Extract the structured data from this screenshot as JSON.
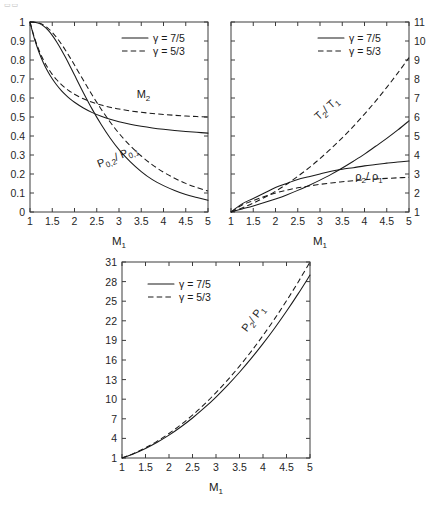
{
  "figure": {
    "corner_mark": "▭▭",
    "background": "#ffffff",
    "line_color": "#1a1a1a"
  },
  "legend": {
    "solid_label": "γ = 7/5",
    "dashed_label": "γ = 5/3",
    "solid_style": "solid",
    "dashed_style": "dashed"
  },
  "chart_data": [
    {
      "id": "panel-1",
      "type": "line",
      "title": "",
      "xlabel": "M₁",
      "ylabel": "",
      "xlim": [
        1,
        5
      ],
      "ylim": [
        0,
        1
      ],
      "xticks": [
        1,
        1.5,
        2,
        2.5,
        3,
        3.5,
        4,
        4.5,
        5
      ],
      "xticklabels": [
        "1",
        "1.5",
        "2",
        "2.5",
        "3",
        "3.5",
        "4",
        "4.5",
        "5"
      ],
      "yticks": [
        0,
        0.1,
        0.2,
        0.3,
        0.4,
        0.5,
        0.6,
        0.7,
        0.8,
        0.9,
        1
      ],
      "yticklabels": [
        "0",
        "0.1",
        "0.2",
        "0.3",
        "0.4",
        "0.5",
        "0.6",
        "0.7",
        "0.8",
        "0.9",
        "1"
      ],
      "y_axis_side": "left",
      "grid": false,
      "legend_position": "upper-right",
      "annotations": [
        {
          "text": "M",
          "sub": "2",
          "x": 3.55,
          "y": 0.6,
          "rotation": 0
        },
        {
          "text": "P",
          "sub": "0,2",
          "text2": "/ P",
          "sub2": "0,1",
          "x": 3.0,
          "y": 0.275,
          "rotation": -22
        }
      ],
      "series": [
        {
          "name": "M2 (γ = 7/5)",
          "style": "solid",
          "x": [
            1,
            1.1,
            1.2,
            1.3,
            1.4,
            1.5,
            1.6,
            1.7,
            1.8,
            1.9,
            2,
            2.2,
            2.4,
            2.6,
            2.8,
            3,
            3.25,
            3.5,
            3.75,
            4,
            4.25,
            4.5,
            4.75,
            5
          ],
          "values": [
            1,
            0.9118,
            0.8422,
            0.786,
            0.7397,
            0.7011,
            0.6684,
            0.6405,
            0.6165,
            0.5956,
            0.5774,
            0.5471,
            0.5231,
            0.5039,
            0.4882,
            0.4752,
            0.4619,
            0.4512,
            0.4423,
            0.435,
            0.4289,
            0.4236,
            0.4192,
            0.4152
          ]
        },
        {
          "name": "M2 (γ = 5/3)",
          "style": "dashed",
          "x": [
            1,
            1.1,
            1.2,
            1.3,
            1.4,
            1.5,
            1.6,
            1.7,
            1.8,
            1.9,
            2,
            2.2,
            2.4,
            2.6,
            2.8,
            3,
            3.25,
            3.5,
            3.75,
            4,
            4.25,
            4.5,
            4.75,
            5
          ],
          "values": [
            1,
            0.9174,
            0.8526,
            0.8009,
            0.759,
            0.7246,
            0.696,
            0.6721,
            0.6518,
            0.6345,
            0.6197,
            0.5957,
            0.5773,
            0.5628,
            0.5513,
            0.5418,
            0.5323,
            0.5247,
            0.5185,
            0.5133,
            0.509,
            0.5053,
            0.5022,
            0.4995
          ]
        },
        {
          "name": "P02/P01 (γ = 7/5)",
          "style": "solid",
          "x": [
            1,
            1.1,
            1.2,
            1.3,
            1.4,
            1.5,
            1.6,
            1.7,
            1.8,
            1.9,
            2,
            2.2,
            2.4,
            2.6,
            2.8,
            3,
            3.25,
            3.5,
            3.75,
            4,
            4.25,
            4.5,
            4.75,
            5
          ],
          "values": [
            1,
            0.9989,
            0.9928,
            0.9794,
            0.9582,
            0.9298,
            0.8952,
            0.8557,
            0.8127,
            0.7674,
            0.7209,
            0.6281,
            0.5401,
            0.4601,
            0.3895,
            0.3283,
            0.2652,
            0.2129,
            0.1702,
            0.1388,
            0.1133,
            0.0917,
            0.0762,
            0.0617
          ]
        },
        {
          "name": "P02/P01 (γ = 5/3)",
          "style": "dashed",
          "x": [
            1,
            1.1,
            1.2,
            1.3,
            1.4,
            1.5,
            1.6,
            1.7,
            1.8,
            1.9,
            2,
            2.2,
            2.4,
            2.6,
            2.8,
            3,
            3.25,
            3.5,
            3.75,
            4,
            4.25,
            4.5,
            4.75,
            5
          ],
          "values": [
            1,
            0.9992,
            0.9946,
            0.9845,
            0.968,
            0.9455,
            0.9178,
            0.8858,
            0.8504,
            0.8126,
            0.7732,
            0.6929,
            0.6146,
            0.5411,
            0.474,
            0.4139,
            0.3497,
            0.2947,
            0.2484,
            0.2096,
            0.1774,
            0.1506,
            0.1284,
            0.11
          ]
        }
      ]
    },
    {
      "id": "panel-2",
      "type": "line",
      "title": "",
      "xlabel": "M₁",
      "ylabel": "",
      "xlim": [
        1,
        5
      ],
      "ylim": [
        1,
        11
      ],
      "xticks": [
        1,
        1.5,
        2,
        2.5,
        3,
        3.5,
        4,
        4.5,
        5
      ],
      "xticklabels": [
        "1",
        "1.5",
        "2",
        "2.5",
        "3",
        "3.5",
        "4",
        "4.5",
        "5"
      ],
      "yticks": [
        1,
        2,
        3,
        4,
        5,
        6,
        7,
        8,
        9,
        10,
        11
      ],
      "yticklabels": [
        "1",
        "2",
        "3",
        "4",
        "5",
        "6",
        "7",
        "8",
        "9",
        "10",
        "11"
      ],
      "y_axis_side": "right",
      "grid": false,
      "legend_position": "upper-right",
      "annotations": [
        {
          "text": "T",
          "sub": "2",
          "text2": "/ T",
          "sub2": "1",
          "x": 3.2,
          "y": 6.3,
          "rotation": -42
        },
        {
          "text": "ρ",
          "sub": "2",
          "text2": "/ ρ",
          "sub2": "1",
          "x": 4.1,
          "y": 2.7,
          "rotation": 0
        }
      ],
      "series": [
        {
          "name": "T2/T1 (γ = 7/5)",
          "style": "solid",
          "x": [
            1,
            1.25,
            1.5,
            1.75,
            2,
            2.25,
            2.5,
            2.75,
            3,
            3.25,
            3.5,
            3.75,
            4,
            4.25,
            4.5,
            4.75,
            5
          ],
          "values": [
            1,
            1.1594,
            1.3202,
            1.4946,
            1.6875,
            1.8999,
            2.1375,
            2.3999,
            2.679,
            2.9793,
            3.315,
            3.6728,
            4.0469,
            4.4594,
            4.875,
            5.3184,
            5.8
          ]
        },
        {
          "name": "T2/T1 (γ = 5/3)",
          "style": "dashed",
          "x": [
            1,
            1.25,
            1.5,
            1.75,
            2,
            2.25,
            2.5,
            2.75,
            3,
            3.25,
            3.5,
            3.75,
            4,
            4.25,
            4.5,
            4.75,
            5
          ],
          "values": [
            1,
            1.2148,
            1.4688,
            1.7622,
            2.0938,
            2.4636,
            2.875,
            3.3211,
            3.8125,
            4.3391,
            4.9063,
            5.5078,
            6.1563,
            6.8354,
            7.5625,
            8.3223,
            9.125
          ]
        },
        {
          "name": "rho2/rho1 (γ = 7/5)",
          "style": "solid",
          "x": [
            1,
            1.25,
            1.5,
            1.75,
            2,
            2.25,
            2.5,
            2.75,
            3,
            3.25,
            3.5,
            3.75,
            4,
            4.25,
            4.5,
            4.75,
            5
          ],
          "values": [
            1,
            1.4286,
            1.7143,
            2.0,
            2.2857,
            2.5,
            2.7143,
            2.8571,
            3.0,
            3.1429,
            3.25,
            3.3333,
            3.4286,
            3.5,
            3.5714,
            3.6364,
            3.6857
          ]
        },
        {
          "name": "rho2/rho1 (γ = 5/3)",
          "style": "dashed",
          "x": [
            1,
            1.25,
            1.5,
            1.75,
            2,
            2.25,
            2.5,
            2.75,
            3,
            3.25,
            3.5,
            3.75,
            4,
            4.25,
            4.5,
            4.75,
            5
          ],
          "values": [
            1,
            1.3636,
            1.6,
            1.8182,
            2.0,
            2.1429,
            2.2727,
            2.3684,
            2.4545,
            2.5301,
            2.5926,
            2.6471,
            2.6957,
            2.7368,
            2.7692,
            2.8,
            2.8269
          ]
        }
      ]
    },
    {
      "id": "panel-3",
      "type": "line",
      "title": "",
      "xlabel": "M₁",
      "ylabel": "",
      "xlim": [
        1,
        5
      ],
      "ylim": [
        1,
        31
      ],
      "xticks": [
        1,
        1.5,
        2,
        2.5,
        3,
        3.5,
        4,
        4.5,
        5
      ],
      "xticklabels": [
        "1",
        "1.5",
        "2",
        "2.5",
        "3",
        "3.5",
        "4",
        "4.5",
        "5"
      ],
      "yticks": [
        1,
        4,
        7,
        10,
        13,
        16,
        19,
        22,
        25,
        28,
        31
      ],
      "yticklabels": [
        "1",
        "4",
        "7",
        "10",
        "13",
        "16",
        "19",
        "22",
        "25",
        "28",
        "31"
      ],
      "y_axis_side": "left",
      "grid": false,
      "legend_position": "upper-left",
      "annotations": [
        {
          "text": "P",
          "sub": "2",
          "text2": "/ P",
          "sub2": "1",
          "x": 3.85,
          "y": 22.0,
          "rotation": -52
        }
      ],
      "series": [
        {
          "name": "P2/P1 (γ = 7/5)",
          "style": "solid",
          "x": [
            1,
            1.25,
            1.5,
            1.75,
            2,
            2.25,
            2.5,
            2.75,
            3,
            3.25,
            3.5,
            3.75,
            4,
            4.25,
            4.5,
            4.75,
            5
          ],
          "values": [
            1,
            1.6563,
            2.4583,
            3.4063,
            4.5,
            5.7396,
            7.125,
            8.6563,
            10.3333,
            12.1563,
            14.125,
            16.2396,
            18.5,
            20.9063,
            23.4583,
            26.1563,
            29.0
          ]
        },
        {
          "name": "P2/P1 (γ = 5/3)",
          "style": "dashed",
          "x": [
            1,
            1.25,
            1.5,
            1.75,
            2,
            2.25,
            2.5,
            2.75,
            3,
            3.25,
            3.5,
            3.75,
            4,
            4.25,
            4.5,
            4.75,
            5
          ],
          "values": [
            1,
            1.7031,
            2.5625,
            3.5781,
            4.75,
            6.0781,
            7.5625,
            9.2031,
            11.0,
            12.9531,
            15.0625,
            17.3281,
            19.75,
            22.3281,
            25.0625,
            27.9531,
            31.0
          ]
        }
      ]
    }
  ]
}
